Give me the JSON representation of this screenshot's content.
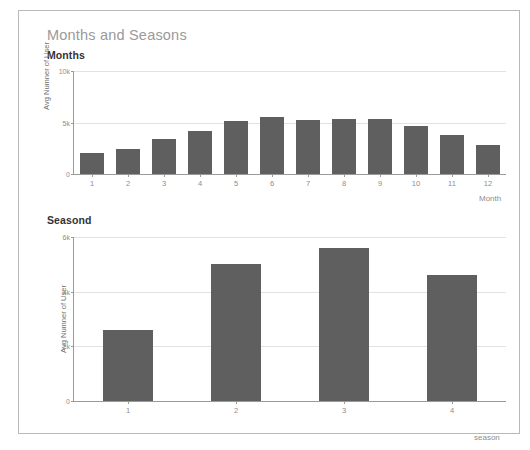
{
  "page": {
    "title": "Months and Seasons"
  },
  "sections": [
    {
      "heading": "Months"
    },
    {
      "heading": "Seasond"
    }
  ],
  "colors": {
    "bar": "#5f5f5f",
    "grid": "#e2e2e2",
    "axis": "#9a9a9a",
    "title": "#9a9a9a",
    "section_heading": "#333333",
    "tick_text": "#8d8d8d",
    "card_border": "#b9b9b9"
  },
  "chart_data": [
    {
      "type": "bar",
      "title": "Months",
      "xlabel": "Month",
      "ylabel": "Avg Numner of User",
      "categories": [
        "1",
        "2",
        "3",
        "4",
        "5",
        "6",
        "7",
        "8",
        "9",
        "10",
        "11",
        "12"
      ],
      "values": [
        2050,
        2400,
        3400,
        4200,
        5100,
        5500,
        5250,
        5300,
        5350,
        4700,
        3750,
        2800
      ],
      "ylim": [
        0,
        10000
      ],
      "yticks": [
        0,
        5000,
        10000
      ],
      "ytick_labels": [
        "0",
        "5k",
        "10k"
      ],
      "grid": true,
      "legend": "none"
    },
    {
      "type": "bar",
      "title": "Seasond",
      "xlabel": "season",
      "ylabel": "Avg Numner of User",
      "categories": [
        "1",
        "2",
        "3",
        "4"
      ],
      "values": [
        2600,
        5000,
        5600,
        4600
      ],
      "ylim": [
        0,
        6000
      ],
      "yticks": [
        0,
        2000,
        4000,
        6000
      ],
      "ytick_labels": [
        "0",
        "2k",
        "4k",
        "6k"
      ],
      "grid": true,
      "legend": "none"
    }
  ]
}
